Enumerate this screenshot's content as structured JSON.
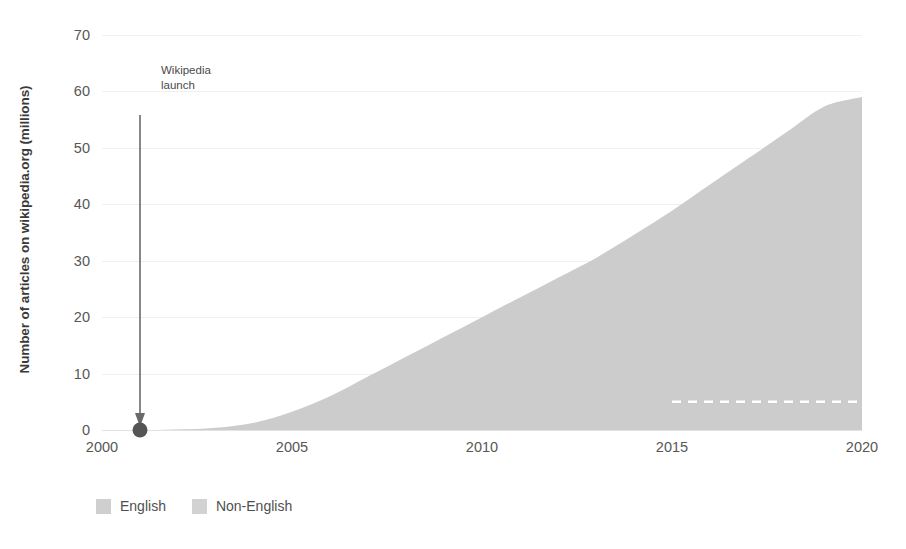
{
  "chart_data": {
    "type": "area",
    "title": "",
    "subtitle": "",
    "xlabel": "",
    "ylabel": "Number of articles on wikipedia.org (millions)",
    "xlim": [
      2000,
      2020
    ],
    "ylim": [
      0,
      70
    ],
    "grid": true,
    "stacked": true,
    "legend_position": "bottom-left",
    "y_ticks": [
      0,
      10,
      20,
      30,
      40,
      50,
      60,
      70
    ],
    "y_tick_labels": [
      "0",
      "10",
      "20",
      "30",
      "40",
      "50",
      "60",
      "70"
    ],
    "x_ticks": [
      2000,
      2005,
      2010,
      2015,
      2020
    ],
    "x_tick_labels": [
      "2000",
      "2005",
      "2010",
      "2015",
      "2020"
    ],
    "x": [
      2000,
      2001,
      2002,
      2003,
      2004,
      2005,
      2006,
      2007,
      2008,
      2009,
      2010,
      2011,
      2012,
      2013,
      2014,
      2015,
      2016,
      2017,
      2018,
      2019,
      2020
    ],
    "series": [
      {
        "name": "English",
        "color": "#cccccc",
        "values": [
          0,
          0.0,
          0.05,
          0.15,
          0.4,
          0.85,
          1.4,
          2.0,
          2.5,
          3.0,
          3.4,
          3.7,
          4.0,
          4.3,
          4.6,
          4.85,
          5.0,
          5.1,
          5.2,
          5.3,
          5.4
        ]
      },
      {
        "name": "Non-English",
        "color": "#cccccc",
        "values": [
          0,
          0.0,
          0.05,
          0.25,
          0.9,
          2.4,
          4.6,
          7.5,
          10.5,
          13.5,
          16.6,
          19.8,
          23.0,
          26.2,
          30.0,
          34.0,
          38.5,
          43.0,
          47.5,
          52.0,
          53.6
        ]
      }
    ],
    "totals": [
      0,
      0.0,
      0.1,
      0.4,
      1.3,
      3.25,
      6.0,
      9.5,
      13.0,
      16.5,
      20.0,
      23.5,
      27.0,
      30.5,
      34.6,
      38.85,
      43.5,
      48.1,
      52.7,
      57.3,
      59.0
    ],
    "annotations": [
      {
        "name": "wikipedia-launch",
        "text": "Wikipedia\nlaunch",
        "x": 2001,
        "y": 0,
        "marker": "dot",
        "marker_color": "#555555",
        "arrow": true
      }
    ],
    "boundary_line": {
      "style": "dashed",
      "color": "#ffffff",
      "x_start": 2015,
      "x_end": 2020,
      "y": 5.0
    }
  },
  "legend": {
    "items": [
      {
        "label": "English",
        "color": "#cfcfcf"
      },
      {
        "label": "Non-English",
        "color": "#d2d2d2"
      }
    ]
  },
  "annotation": {
    "line1": "Wikipedia",
    "line2": "launch"
  },
  "axes": {
    "y_title": "Number of articles on wikipedia.org (millions)",
    "y_labels": [
      "70",
      "60",
      "50",
      "40",
      "30",
      "20",
      "10",
      "0"
    ],
    "x_labels": [
      "2000",
      "2005",
      "2010",
      "2015",
      "2020"
    ]
  },
  "colors": {
    "area_fill": "#cccccc",
    "gridline": "#f0f0f0",
    "baseline": "#e2e2e2",
    "text": "#575757",
    "marker": "#555555",
    "dash_line": "#ffffff"
  }
}
